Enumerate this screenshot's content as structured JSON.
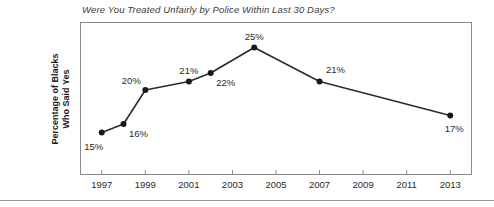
{
  "chart_data": {
    "type": "line",
    "title": "Were You Treated Unfairly by Police Within Last 30 Days?",
    "xlabel": "",
    "ylabel": "Percentage of Blacks Who Said Yes",
    "ylabel_lines": [
      "Percentage of Blacks",
      "Who Said Yes"
    ],
    "x": [
      1997,
      1998,
      1999,
      2001,
      2002,
      2004,
      2007,
      2013
    ],
    "values": [
      15,
      16,
      20,
      21,
      22,
      25,
      21,
      17
    ],
    "point_labels": [
      "15%",
      "16%",
      "20%",
      "21%",
      "22%",
      "25%",
      "21%",
      "17%"
    ],
    "xlim": [
      1996,
      2014
    ],
    "ylim": [
      10,
      28
    ],
    "xticks": [
      1997,
      1999,
      2001,
      2003,
      2005,
      2007,
      2009,
      2011,
      2013
    ],
    "xtick_labels": [
      "1997",
      "1999",
      "2001",
      "2003",
      "2005",
      "2007",
      "2009",
      "2011",
      "2013"
    ],
    "yticks": [],
    "ytick_labels": [],
    "grid": false,
    "legend": null,
    "line_color": "#2b2b2b",
    "marker_color": "#1a1a1a",
    "frame_color": "#8a8a8a",
    "background": "#ffffff",
    "series": [
      {
        "name": "Percentage of Blacks Who Said Yes",
        "points": [
          {
            "x": 1997,
            "y": 15,
            "label": "15%",
            "label_pos": "below-left"
          },
          {
            "x": 1998,
            "y": 16,
            "label": "16%",
            "label_pos": "below-right"
          },
          {
            "x": 1999,
            "y": 20,
            "label": "20%",
            "label_pos": "above-left"
          },
          {
            "x": 2001,
            "y": 21,
            "label": "21%",
            "label_pos": "above"
          },
          {
            "x": 2002,
            "y": 22,
            "label": "22%",
            "label_pos": "below-right"
          },
          {
            "x": 2004,
            "y": 25,
            "label": "25%",
            "label_pos": "above"
          },
          {
            "x": 2007,
            "y": 21,
            "label": "21%",
            "label_pos": "above-right"
          },
          {
            "x": 2013,
            "y": 17,
            "label": "17%",
            "label_pos": "below"
          }
        ]
      }
    ]
  },
  "figure": {
    "title": "Were You Treated Unfairly by Police Within Last 30 Days?",
    "ylabel_line1": "Percentage of Blacks",
    "ylabel_line2": "Who Said Yes"
  }
}
